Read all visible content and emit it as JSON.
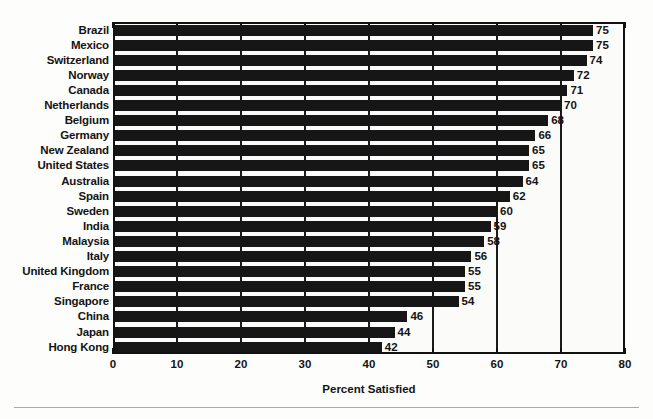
{
  "chart_data": {
    "type": "bar",
    "orientation": "horizontal",
    "title": "",
    "subtitle": "",
    "xlabel": "Percent Satisfied",
    "ylabel": "",
    "xlim": [
      0,
      80
    ],
    "xticks": [
      0,
      10,
      20,
      30,
      40,
      50,
      60,
      70,
      80
    ],
    "grid": true,
    "grid_axis": "x",
    "legend": null,
    "bar_color": "#161616",
    "background_color": "#fbfbfa",
    "axis_color": "#121212",
    "text_color": "#141414",
    "categories": [
      "Brazil",
      "Mexico",
      "Switzerland",
      "Norway",
      "Canada",
      "Netherlands",
      "Belgium",
      "Germany",
      "New Zealand",
      "United States",
      "Australia",
      "Spain",
      "Sweden",
      "India",
      "Malaysia",
      "Italy",
      "United Kingdom",
      "France",
      "Singapore",
      "China",
      "Japan",
      "Hong Kong"
    ],
    "values": [
      75,
      75,
      74,
      72,
      71,
      70,
      68,
      66,
      65,
      65,
      64,
      62,
      60,
      59,
      58,
      56,
      55,
      55,
      54,
      46,
      44,
      42
    ],
    "data_labels": [
      "75",
      "75",
      "74",
      "72",
      "71",
      "70",
      "68",
      "66",
      "65",
      "65",
      "64",
      "62",
      "60",
      "59",
      "58",
      "56",
      "55",
      "55",
      "54",
      "46",
      "44",
      "42"
    ]
  },
  "axis": {
    "x_tick_labels": [
      "0",
      "10",
      "20",
      "30",
      "40",
      "50",
      "60",
      "70",
      "80"
    ],
    "x_title": "Percent Satisfied"
  }
}
